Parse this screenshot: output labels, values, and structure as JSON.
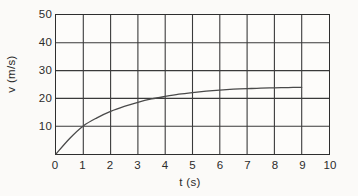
{
  "chart_data": {
    "type": "line",
    "title": "",
    "xlabel": "t (s)",
    "ylabel": "v (m/s)",
    "xlim": [
      0,
      10
    ],
    "ylim": [
      0,
      50
    ],
    "xticks": [
      "0",
      "1",
      "2",
      "3",
      "4",
      "5",
      "6",
      "7",
      "8",
      "9",
      "10"
    ],
    "yticks": [
      "0",
      "10",
      "20",
      "30",
      "40",
      "50"
    ],
    "grid": true,
    "legend": null,
    "series": [
      {
        "name": "velocity",
        "color": "#4a4a4a",
        "x": [
          0,
          0.5,
          1,
          1.5,
          2,
          2.5,
          3,
          3.5,
          4,
          4.5,
          5,
          5.5,
          6,
          6.5,
          7,
          7.5,
          8,
          8.5,
          9
        ],
        "values": [
          0,
          5.6,
          10.1,
          13.0,
          15.3,
          17.1,
          18.6,
          19.8,
          20.7,
          21.5,
          22.1,
          22.6,
          23.0,
          23.3,
          23.5,
          23.7,
          23.8,
          23.9,
          24.0
        ]
      }
    ],
    "annotations": []
  },
  "axes": {
    "x_tick_labels": [
      "0",
      "1",
      "2",
      "3",
      "4",
      "5",
      "6",
      "7",
      "8",
      "9",
      "10"
    ],
    "y_tick_labels": [
      "0",
      "10",
      "20",
      "30",
      "40",
      "50"
    ],
    "x_title": "t (s)",
    "y_title": "v (m/s)"
  },
  "style": {
    "background": "#fbfaf8",
    "plot_background": "#fdfcfa",
    "grid_color": "#3a3a3a",
    "frame_color": "#2e2e2e",
    "curve_color": "#4a4a4a",
    "text_color": "#2b2b2b"
  }
}
